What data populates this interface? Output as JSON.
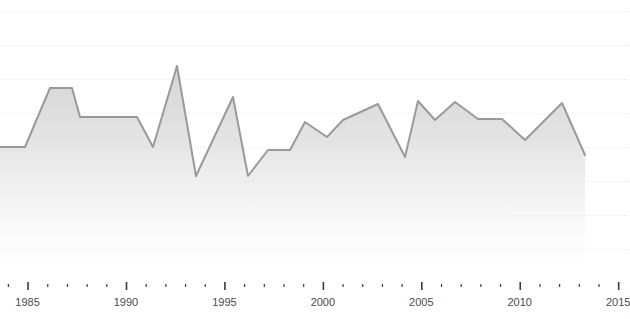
{
  "chart_data": {
    "type": "area",
    "title": "",
    "subtitle": "",
    "xlabel": "",
    "ylabel": "",
    "grid": true,
    "legend": null,
    "legend_position": "none",
    "line_color": "#9a9a9a",
    "fill_color": "#d9d9d9",
    "grid_color": "#e9e9e9",
    "background_color": "#ffffff",
    "axis_label_color": "#4a4a4a",
    "xlim": [
      1983.6,
      2015.6
    ],
    "ylim": [
      0,
      100
    ],
    "x_major_tick_labels": [
      "1985",
      "1990",
      "1995",
      "2000",
      "2005",
      "2010",
      "2015"
    ],
    "x_major_ticks": [
      1985,
      1990,
      1995,
      2000,
      2005,
      2010,
      2015
    ],
    "x_minor_tick_interval": 1,
    "y_gridline_count": 8,
    "x": [
      1983.6,
      1984.7,
      1986.2,
      1987.1,
      1987.5,
      1991.4,
      1992.1,
      1993.6,
      1994.4,
      1995.9,
      1996.5,
      1997.4,
      1998.4,
      1999.3,
      2000.0,
      2000.9,
      2001.6,
      2003.1,
      2004.2,
      2004.7,
      2005.2,
      2005.9,
      2006.8,
      2007.4,
      2008.1,
      2009.1,
      2010.1,
      2011.1,
      2012.2,
      2013.8,
      2014.7
    ],
    "values": [
      55,
      55,
      76,
      76,
      65,
      65,
      55,
      96,
      55,
      83,
      55,
      56,
      56,
      66,
      62,
      68,
      68,
      73,
      54,
      75,
      68,
      74,
      74,
      69,
      69,
      62,
      55,
      64,
      74,
      74,
      53
    ],
    "series": [
      {
        "name": "series-1",
        "values": [
          55,
          55,
          76,
          76,
          65,
          65,
          55,
          96,
          55,
          83,
          55,
          56,
          56,
          66,
          62,
          68,
          68,
          73,
          54,
          75,
          68,
          74,
          74,
          69,
          69,
          62,
          55,
          64,
          74,
          74,
          53
        ]
      }
    ],
    "points_px": [
      [
        0,
        147
      ],
      [
        25,
        147
      ],
      [
        50,
        88
      ],
      [
        72,
        88
      ],
      [
        80,
        117
      ],
      [
        137,
        117
      ],
      [
        153,
        147
      ],
      [
        177,
        66
      ],
      [
        196,
        176
      ],
      [
        233,
        97
      ],
      [
        248,
        176
      ],
      [
        268,
        150
      ],
      [
        290,
        150
      ],
      [
        305,
        122
      ],
      [
        327,
        137
      ],
      [
        343,
        120
      ],
      [
        378,
        104
      ],
      [
        405,
        157
      ],
      [
        418,
        101
      ],
      [
        435,
        120
      ],
      [
        455,
        102
      ],
      [
        478,
        119
      ],
      [
        502,
        119
      ],
      [
        525,
        140
      ],
      [
        562,
        103
      ],
      [
        585,
        155
      ]
    ],
    "gridlines_y_px": [
      11,
      45,
      79,
      113,
      147,
      181,
      215,
      249
    ]
  }
}
